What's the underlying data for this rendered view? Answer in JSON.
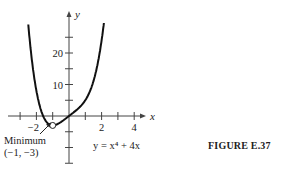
{
  "figure_label": "FIGURE E.37",
  "chart_data": {
    "type": "line",
    "title": "",
    "function": "y = x^4 + 4x",
    "equation_label": "y = x⁴ + 4x",
    "xlabel": "x",
    "ylabel": "y",
    "xlim": [
      -3.5,
      4.5
    ],
    "ylim": [
      -17,
      28
    ],
    "x_ticks": [
      -3,
      -2,
      -1,
      1,
      2,
      3,
      4
    ],
    "x_tick_labels": [
      {
        "value": -2,
        "label": "−2"
      },
      {
        "value": 2,
        "label": "2"
      },
      {
        "value": 4,
        "label": "4"
      }
    ],
    "y_ticks": [
      -15,
      -10,
      -5,
      5,
      10,
      15,
      20,
      25
    ],
    "y_tick_labels": [
      {
        "value": 10,
        "label": "10"
      },
      {
        "value": 20,
        "label": "20"
      }
    ],
    "grid": false,
    "series": [
      {
        "name": "y = x^4 + 4x",
        "x": [
          -2.6,
          -2.4,
          -2.2,
          -2.0,
          -1.8,
          -1.6,
          -1.4,
          -1.2,
          -1.0,
          -0.8,
          -0.6,
          -0.4,
          -0.2,
          0.0,
          0.2,
          0.4,
          0.6,
          0.8,
          1.0,
          1.2,
          1.4,
          1.6,
          1.8,
          2.0,
          2.2
        ],
        "y": [
          35.3,
          23.6,
          14.6,
          8.0,
          3.3,
          0.2,
          -1.8,
          -2.7,
          -3.0,
          -2.8,
          -2.3,
          -1.6,
          -0.8,
          0.0,
          0.8,
          1.6,
          2.5,
          3.6,
          5.0,
          6.9,
          9.4,
          12.9,
          17.7,
          24.0,
          32.2
        ]
      }
    ],
    "annotations": [
      {
        "text": "Minimum",
        "sub": "(−1, −3)",
        "x": -1,
        "y": -3,
        "marker": "open-circle",
        "arrow": true
      }
    ]
  }
}
